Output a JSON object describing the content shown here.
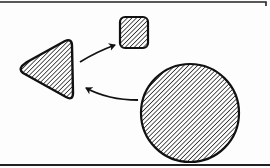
{
  "diagram": {
    "colors": {
      "stroke": "#111111",
      "hatch": "#222222",
      "background": "#fdfdfd"
    },
    "frame": {
      "top_border": {
        "x1": 0,
        "x2": 266,
        "y": 2
      },
      "bottom_border": {
        "x1": 0,
        "x2": 270,
        "y": 165
      }
    },
    "shapes": [
      {
        "id": "triangle",
        "type": "rounded-triangle",
        "fill": "diagonal-hatch",
        "points": [
          [
            20,
            69
          ],
          [
            70,
            40
          ],
          [
            73,
            98
          ]
        ]
      },
      {
        "id": "square",
        "type": "rounded-square",
        "fill": "diagonal-hatch",
        "x": 120,
        "y": 17,
        "width": 28,
        "height": 31,
        "radius": 5
      },
      {
        "id": "circle",
        "type": "circle",
        "fill": "diagonal-hatch",
        "cx": 190,
        "cy": 113,
        "r": 49
      }
    ],
    "connectors": [
      {
        "id": "arrow-triangle-to-square",
        "from": "triangle",
        "to": "square",
        "style": "curved-arrow"
      },
      {
        "id": "arrow-circle-to-triangle",
        "from": "circle",
        "to": "triangle",
        "style": "curved-arrow"
      }
    ]
  }
}
